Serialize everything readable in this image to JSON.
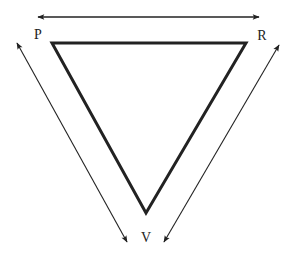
{
  "diagram": {
    "type": "triangle-with-relation-arrows",
    "labels": {
      "p": "P",
      "r": "R",
      "v": "V"
    },
    "vertices": {
      "P": [
        52,
        43
      ],
      "R": [
        246,
        43
      ],
      "V": [
        146,
        213
      ]
    },
    "arrows": [
      {
        "name": "P-R",
        "from": [
          38,
          17
        ],
        "to": [
          259,
          17
        ],
        "double_headed": true
      },
      {
        "name": "P-V",
        "from": [
          17,
          43
        ],
        "to": [
          127,
          242
        ],
        "double_headed": true
      },
      {
        "name": "R-V",
        "from": [
          279,
          45
        ],
        "to": [
          164,
          242
        ],
        "double_headed": true
      }
    ],
    "colors": {
      "stroke": "#222222",
      "background": "#ffffff"
    }
  }
}
